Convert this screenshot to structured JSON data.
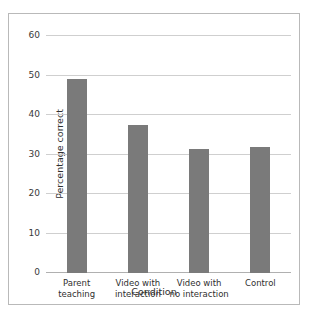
{
  "chart_data": {
    "type": "bar",
    "title": "",
    "xlabel": "Condition",
    "ylabel": "Percentage correct",
    "categories": [
      "Parent\nteaching",
      "Video with\ninteraction",
      "Video with\nno interaction",
      "Control"
    ],
    "category_lines": [
      [
        "Parent",
        "teaching"
      ],
      [
        "Video with",
        "interaction"
      ],
      [
        "Video with",
        "no interaction"
      ],
      [
        "Control"
      ]
    ],
    "values": [
      49,
      37.5,
      31.5,
      32
    ],
    "ylim": [
      0,
      60
    ],
    "yticks": [
      0,
      10,
      20,
      30,
      40,
      50,
      60
    ],
    "ytick_labels": [
      "0",
      "10",
      "20",
      "30",
      "40",
      "50",
      "60"
    ],
    "grid": true,
    "legend": false,
    "bar_color": "#7a7a7a",
    "gridline_color": "#cfcfcf",
    "frame_color": "#b9b9b9",
    "background": "#ffffff"
  }
}
